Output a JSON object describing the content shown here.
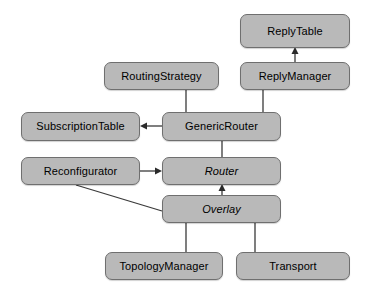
{
  "diagram": {
    "kind": "class-diagram",
    "background_color": "#ffffff",
    "node_fill_color": "#b9b9b9",
    "node_border_color": "#6f6f6f",
    "node_text_color": "#000000",
    "edge_color": "#3a3a3a",
    "nodes": [
      {
        "id": "reply-table",
        "label": "ReplyTable",
        "x": 240,
        "y": 14,
        "w": 110,
        "h": 34,
        "italic": false
      },
      {
        "id": "routing-strategy",
        "label": "RoutingStrategy",
        "x": 104,
        "y": 62,
        "w": 115,
        "h": 28,
        "italic": false
      },
      {
        "id": "reply-manager",
        "label": "ReplyManager",
        "x": 240,
        "y": 62,
        "w": 110,
        "h": 28,
        "italic": false
      },
      {
        "id": "subscription-table",
        "label": "SubscriptionTable",
        "x": 21,
        "y": 112,
        "w": 119,
        "h": 29,
        "italic": false
      },
      {
        "id": "generic-router",
        "label": "GenericRouter",
        "x": 162,
        "y": 112,
        "w": 119,
        "h": 29,
        "italic": false
      },
      {
        "id": "reconfigurator",
        "label": "Reconfigurator",
        "x": 21,
        "y": 157,
        "w": 119,
        "h": 28,
        "italic": false
      },
      {
        "id": "router",
        "label": "Router",
        "x": 162,
        "y": 157,
        "w": 119,
        "h": 28,
        "italic": true
      },
      {
        "id": "overlay",
        "label": "Overlay",
        "x": 162,
        "y": 195,
        "w": 119,
        "h": 28,
        "italic": true
      },
      {
        "id": "topology-manager",
        "label": "TopologyManager",
        "x": 105,
        "y": 252,
        "w": 118,
        "h": 28,
        "italic": false
      },
      {
        "id": "transport",
        "label": "Transport",
        "x": 236,
        "y": 252,
        "w": 114,
        "h": 28,
        "italic": false
      }
    ],
    "edges": [
      {
        "id": "reply-manager-to-reply-table",
        "from": "reply-manager",
        "to": "reply-table",
        "kind": "arrow",
        "points": "295,62 295,50",
        "arrow_at": "295,48",
        "arrow_dir": "up"
      },
      {
        "id": "routing-strategy-to-generic-router",
        "from": "routing-strategy",
        "to": "generic-router",
        "kind": "line",
        "points": "186,90 186,112",
        "arrow_at": "",
        "arrow_dir": ""
      },
      {
        "id": "reply-manager-to-generic-router",
        "from": "reply-manager",
        "to": "generic-router",
        "kind": "line",
        "points": "263,90 263,112",
        "arrow_at": "",
        "arrow_dir": ""
      },
      {
        "id": "generic-router-to-subscription-table",
        "from": "generic-router",
        "to": "subscription-table",
        "kind": "arrow",
        "points": "162,126 144,126",
        "arrow_at": "140,126",
        "arrow_dir": "left"
      },
      {
        "id": "generic-router-to-router",
        "from": "generic-router",
        "to": "router",
        "kind": "line",
        "points": "222,141 222,157",
        "arrow_at": "",
        "arrow_dir": ""
      },
      {
        "id": "reconfigurator-to-router",
        "from": "reconfigurator",
        "to": "router",
        "kind": "arrow",
        "points": "140,171 158,171",
        "arrow_at": "162,171",
        "arrow_dir": "right"
      },
      {
        "id": "overlay-to-router",
        "from": "overlay",
        "to": "router",
        "kind": "arrow",
        "points": "222,195 222,188",
        "arrow_at": "222,185",
        "arrow_dir": "up"
      },
      {
        "id": "reconfigurator-to-overlay",
        "from": "reconfigurator",
        "to": "overlay",
        "kind": "diagonal",
        "points": "76,185 162,211",
        "arrow_at": "",
        "arrow_dir": ""
      },
      {
        "id": "overlay-to-topology-manager",
        "from": "overlay",
        "to": "topology-manager",
        "kind": "line",
        "points": "186,223 186,252",
        "arrow_at": "",
        "arrow_dir": ""
      },
      {
        "id": "overlay-to-transport",
        "from": "overlay",
        "to": "transport",
        "kind": "line",
        "points": "255,223 255,252",
        "arrow_at": "",
        "arrow_dir": ""
      }
    ]
  }
}
